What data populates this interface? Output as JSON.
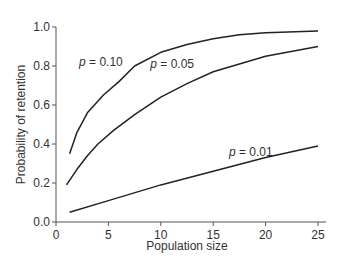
{
  "chart_data": {
    "type": "line",
    "title": "",
    "xlabel": "Population size",
    "ylabel": "Probability of retention",
    "xlim": [
      0,
      25
    ],
    "ylim": [
      0,
      1.0
    ],
    "xticks": [
      "0",
      "5",
      "10",
      "15",
      "20",
      "25"
    ],
    "yticks": [
      "0.0",
      "0.2",
      "0.4",
      "0.6",
      "0.8",
      "1.0"
    ],
    "grid": false,
    "legend": "inline labels",
    "series": [
      {
        "name": "p = 0.10",
        "x": [
          1.3,
          2,
          3,
          4.5,
          6,
          7.5,
          10,
          12.5,
          15,
          17.5,
          20,
          25
        ],
        "y": [
          0.35,
          0.46,
          0.56,
          0.65,
          0.72,
          0.8,
          0.87,
          0.91,
          0.94,
          0.96,
          0.97,
          0.98
        ]
      },
      {
        "name": "p = 0.05",
        "x": [
          1,
          2,
          3,
          4,
          5.5,
          7.5,
          10,
          12.5,
          15,
          17.5,
          20,
          25
        ],
        "y": [
          0.19,
          0.27,
          0.34,
          0.4,
          0.47,
          0.55,
          0.64,
          0.71,
          0.77,
          0.81,
          0.85,
          0.9
        ]
      },
      {
        "name": "p = 0.01",
        "x": [
          1.3,
          5,
          10,
          15,
          20,
          25
        ],
        "y": [
          0.05,
          0.11,
          0.19,
          0.26,
          0.33,
          0.39
        ]
      }
    ],
    "annotations": [
      {
        "text": "p = 0.10",
        "x": 2.2,
        "y": 0.8
      },
      {
        "text": "p = 0.05",
        "x": 9.0,
        "y": 0.79
      },
      {
        "text": "p = 0.01",
        "x": 16.5,
        "y": 0.34
      }
    ]
  }
}
